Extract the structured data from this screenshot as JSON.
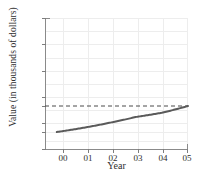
{
  "chart_data": {
    "type": "line",
    "title": "",
    "xlabel": "Year",
    "ylabel": "Value (in thousands of dollars)",
    "x": [
      "00",
      "01",
      "02",
      "03",
      "04",
      "05"
    ],
    "x_numeric": [
      0,
      1,
      2,
      3,
      4,
      5
    ],
    "series": [
      {
        "name": "value",
        "values": [
          10,
          12.3,
          15.1,
          18.5,
          21.0,
          25.0
        ],
        "color": "#5a5a5a",
        "style": "solid",
        "width": 2
      }
    ],
    "reference_lines": [
      {
        "name": "value-25-reference",
        "axis": "y",
        "value": 25,
        "style": "dashed",
        "color": "#4a4a4a"
      }
    ],
    "ytick_labels": [
      "75",
      "60",
      "45",
      "30",
      "25",
      "15",
      "10",
      "0"
    ],
    "ytick_values": [
      75,
      60,
      45,
      30,
      25,
      15,
      10,
      0
    ],
    "xtick_labels": [
      "00",
      "01",
      "02",
      "03",
      "04",
      "05"
    ],
    "ylim": [
      0,
      75
    ],
    "xlim": [
      -0.45,
      5.0
    ],
    "grid": true,
    "grid_color": "#ededed",
    "axis_color": "#8a8a8a",
    "background": "#ffffff",
    "legend": "none"
  }
}
